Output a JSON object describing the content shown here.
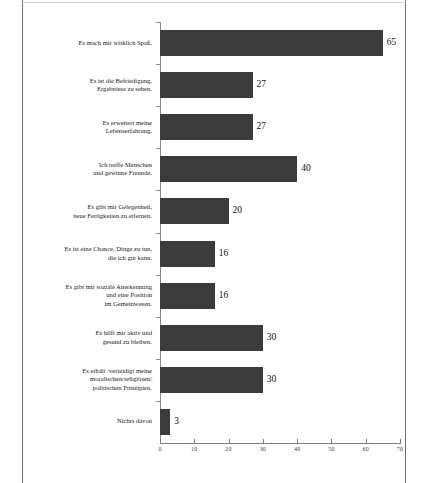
{
  "chart_data": {
    "type": "bar",
    "orientation": "horizontal",
    "title": "",
    "xlabel": "",
    "ylabel": "",
    "xlim": [
      0,
      70
    ],
    "xticks": [
      0,
      10,
      20,
      30,
      40,
      50,
      60,
      70
    ],
    "grid": false,
    "legend": null,
    "bar_color": "#3b3b3b",
    "categories": [
      "Es mach mir wirklich Spaß.",
      "Es ist die Befriedigung,\nErgebnisse zu sehen.",
      "Es erweitert meine\nLebenserfahrung.",
      "Ich treffe Menschen\nund gewinne Freunde.",
      "Es gibt mir Gelegenheit,\nneue Fertigkeiten zu erlernen.",
      "Es ist eine Chance, Dinge zu tun,\ndie ich gut kann.",
      "Es gibt mir soziale Anerkennung\nund eine Position\nim Gemeinwesen.",
      "Es hilft mir aktiv und\ngesund zu bleiben.",
      "Es erhält /verteidigt meine\nmoralischen/religiösen/\npolitischen Prinzipien.",
      "Nichts davon"
    ],
    "values": [
      65,
      27,
      27,
      40,
      20,
      16,
      16,
      30,
      30,
      3
    ],
    "value_labels": [
      "65",
      "27",
      "27",
      "40",
      "20",
      "16",
      "16",
      "30",
      "30",
      "3"
    ]
  }
}
